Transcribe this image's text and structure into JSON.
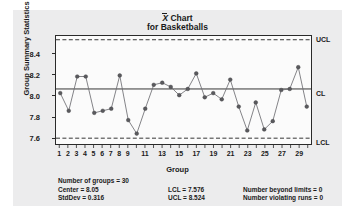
{
  "title": {
    "symbol": "X",
    "line1_suffix": " Chart",
    "line2": "for Basketballs"
  },
  "axes": {
    "ylabel": "Group Summary Statistics",
    "xlabel": "Group",
    "yticks": [
      "8.4",
      "8.2",
      "8.0",
      "7.8",
      "7.6"
    ],
    "ytick_values": [
      8.4,
      8.2,
      8.0,
      7.8,
      7.6
    ],
    "ylim": [
      7.52,
      8.56
    ],
    "xticks": [
      "1",
      "2",
      "3",
      "4",
      "5",
      "6",
      "7",
      "8",
      "9",
      "11",
      "13",
      "15",
      "17",
      "19",
      "21",
      "23",
      "25",
      "27",
      "29"
    ],
    "xtick_values": [
      1,
      2,
      3,
      4,
      5,
      6,
      7,
      8,
      9,
      11,
      13,
      15,
      17,
      19,
      21,
      23,
      25,
      27,
      29
    ]
  },
  "limit_labels": {
    "ucl": "UCL",
    "cl": "CL",
    "lcl": "LCL"
  },
  "stats": {
    "number_of_groups": "Number of groups = 30",
    "center": "Center = 8.05",
    "stddev": "StdDev = 0.316",
    "lcl": "LCL = 7.576",
    "ucl": "UCL = 8.524",
    "beyond_limits": "Number beyond limits = 0",
    "violating_runs": "Number violating runs = 0"
  },
  "colors": {
    "line": "#6e6e72",
    "marker": "#5a5a5e",
    "frame": "#2a2a2a",
    "panel": "#ececed",
    "plot_bg": "#fbfbfb"
  },
  "chart_data": {
    "type": "line",
    "subtitle": "for Basketballs",
    "xlabel": "Group",
    "ylabel": "Group Summary Statistics",
    "xlim": [
      0.5,
      30.5
    ],
    "ylim": [
      7.52,
      8.56
    ],
    "grid": false,
    "legend": null,
    "x": [
      1,
      2,
      3,
      4,
      5,
      6,
      7,
      8,
      9,
      10,
      11,
      12,
      13,
      14,
      15,
      16,
      17,
      18,
      19,
      20,
      21,
      22,
      23,
      24,
      25,
      26,
      27,
      28,
      29,
      30
    ],
    "series": [
      {
        "name": "Group Summary Statistics",
        "values": [
          8.01,
          7.84,
          8.17,
          8.17,
          7.82,
          7.84,
          7.86,
          8.18,
          7.75,
          7.62,
          7.86,
          8.09,
          8.11,
          8.07,
          7.99,
          8.05,
          8.2,
          7.97,
          8.01,
          7.95,
          8.14,
          7.88,
          7.65,
          7.92,
          7.66,
          7.74,
          8.04,
          8.05,
          8.26,
          7.88
        ]
      }
    ],
    "reference_lines": [
      {
        "name": "UCL",
        "value": 8.524,
        "style": "dashed"
      },
      {
        "name": "CL",
        "value": 8.05,
        "style": "solid"
      },
      {
        "name": "LCL",
        "value": 7.576,
        "style": "dashed"
      }
    ],
    "annotations": [
      "Number of groups = 30",
      "Center = 8.05",
      "StdDev = 0.316",
      "LCL = 7.576",
      "UCL = 8.524",
      "Number beyond limits = 0",
      "Number violating runs = 0"
    ]
  }
}
